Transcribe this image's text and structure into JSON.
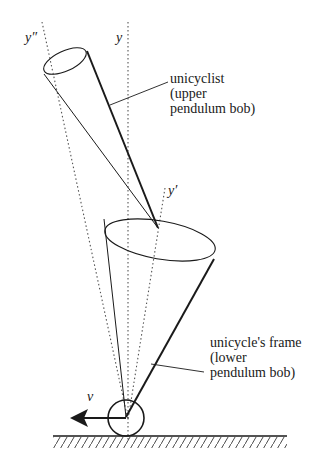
{
  "diagram": {
    "axes": [
      {
        "id": "y",
        "label": "y"
      },
      {
        "id": "y_prime",
        "label": "y′"
      },
      {
        "id": "y_double_prime",
        "label": "y″"
      }
    ],
    "velocity": {
      "label": "v"
    },
    "callouts": {
      "upper": {
        "line1": "unicyclist",
        "line2": "(upper",
        "line3": "pendulum bob)"
      },
      "lower": {
        "line1": "unicycle's frame",
        "line2": "(lower",
        "line3": "pendulum bob)"
      }
    },
    "colors": {
      "stroke": "#1a1a1a",
      "dotted": "#555555",
      "background": "#ffffff"
    }
  }
}
